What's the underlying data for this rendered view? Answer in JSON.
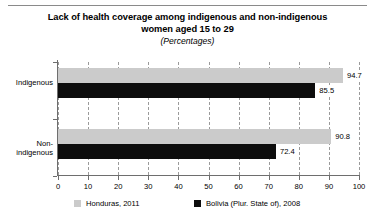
{
  "chart_data": {
    "type": "bar",
    "orientation": "horizontal",
    "title": "Lack of health coverage among indigenous and non-indigenous women aged 15 to 29",
    "title_line1": "Lack of health coverage among indigenous and non-indigenous",
    "title_line2": "women aged 15 to 29",
    "subtitle": "(Percentages)",
    "xlabel": "",
    "ylabel": "",
    "xlim": [
      0,
      100
    ],
    "xticks": [
      0,
      10,
      20,
      30,
      40,
      50,
      60,
      70,
      80,
      90,
      100
    ],
    "xtick_labels": [
      "0",
      "10",
      "20",
      "30",
      "40",
      "50",
      "60",
      "70",
      "80",
      "90",
      "100"
    ],
    "grid": "vertical-dashed",
    "legend_position": "bottom",
    "categories": [
      "Indigenous",
      "Non-indigenous"
    ],
    "category_label_lines": [
      [
        "Indigenous"
      ],
      [
        "Non-",
        "indigenous"
      ]
    ],
    "series": [
      {
        "name": "Honduras, 2011",
        "color": "#cbcbcb",
        "values": [
          94.7,
          90.8
        ],
        "value_labels": [
          "94.7",
          "90.8"
        ]
      },
      {
        "name": "Bolivia (Plur. State of), 2008",
        "color": "#0d0d0d",
        "values": [
          85.5,
          72.4
        ],
        "value_labels": [
          "85.5",
          "72.4"
        ]
      }
    ]
  },
  "legend": {
    "items": [
      {
        "label": "Honduras, 2011",
        "color": "#cbcbcb"
      },
      {
        "label": "Bolivia (Plur. State of), 2008",
        "color": "#0d0d0d"
      }
    ]
  }
}
